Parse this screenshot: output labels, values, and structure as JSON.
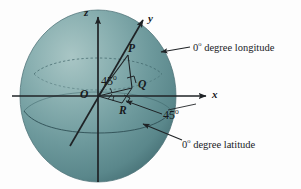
{
  "figure": {
    "background_color": "#fdfdfd",
    "sphere": {
      "fill_light": "#8fb4b4",
      "fill_mid": "#6e9a9c",
      "fill_dark": "#4e7a7e",
      "outline_color": "#4d7377",
      "center_x": 98,
      "center_y": 96,
      "radius_x": 78,
      "radius_y": 86
    },
    "axes": [
      {
        "name": "z",
        "label": "z",
        "label_x": 84,
        "label_y": 8
      },
      {
        "name": "y",
        "label": "y",
        "label_x": 148,
        "label_y": 14
      },
      {
        "name": "x",
        "label": "x",
        "label_x": 212,
        "label_y": 92
      }
    ],
    "points": [
      {
        "name": "O",
        "label": "O",
        "label_x": 81,
        "label_y": 92
      },
      {
        "name": "P",
        "label": "P",
        "label_x": 128,
        "label_y": 46
      },
      {
        "name": "Q",
        "label": "Q",
        "label_x": 138,
        "label_y": 82
      },
      {
        "name": "R",
        "label": "R",
        "label_x": 120,
        "label_y": 109
      }
    ],
    "angles": [
      {
        "name": "elevation-angle",
        "value": "45",
        "unit": "o",
        "x": 102,
        "y": 80
      },
      {
        "name": "azimuth-angle",
        "value": "45",
        "unit": "o",
        "x": 164,
        "y": 113
      }
    ],
    "callouts": [
      {
        "name": "longitude-callout",
        "value": "0",
        "unit": "o",
        "text": " degree longitude",
        "x": 193,
        "y": 45
      },
      {
        "name": "latitude-callout",
        "value": "0",
        "unit": "o",
        "text": " degree latitude",
        "x": 182,
        "y": 142
      }
    ],
    "line_color": "#1f2326",
    "dashed_color": "#3c5f63"
  }
}
